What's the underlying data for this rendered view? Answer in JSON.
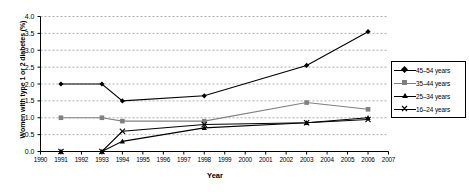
{
  "chart_data": {
    "type": "line",
    "title": "",
    "xlabel": "Year",
    "ylabel": "Women with type 1 or 2 diabetes (%)",
    "xlim": [
      1990,
      2007
    ],
    "ylim": [
      0.0,
      4.0
    ],
    "grid": true,
    "legend_position": "right",
    "xticks": [
      "1990",
      "1991",
      "1992",
      "1993",
      "1994",
      "1995",
      "1996",
      "1997",
      "1998",
      "1999",
      "2000",
      "2001",
      "2002",
      "2003",
      "2004",
      "2005",
      "2006",
      "2007"
    ],
    "yticks": [
      "0.0",
      "0.5",
      "1.0",
      "1.5",
      "2.0",
      "2.5",
      "3.0",
      "3.5",
      "4.0"
    ],
    "series": [
      {
        "name": "45–54 years",
        "marker": "diamond",
        "color": "#000000",
        "x": [
          1991,
          1993,
          1994,
          1998,
          2003,
          2006
        ],
        "values": [
          2.0,
          2.0,
          1.5,
          1.65,
          2.55,
          3.55
        ]
      },
      {
        "name": "35–44 years",
        "marker": "square",
        "color": "#808080",
        "x": [
          1991,
          1993,
          1994,
          1998,
          2003,
          2006
        ],
        "values": [
          1.0,
          1.0,
          0.9,
          0.9,
          1.45,
          1.25
        ]
      },
      {
        "name": "25–34 years",
        "marker": "triangle",
        "color": "#000000",
        "x": [
          1991,
          1993,
          1994,
          1998,
          2003,
          2006
        ],
        "values": [
          0.0,
          0.0,
          0.3,
          0.7,
          0.85,
          1.0
        ]
      },
      {
        "name": "16–24 years",
        "marker": "cross",
        "color": "#000000",
        "x": [
          1991,
          1993,
          1994,
          1998,
          2003,
          2006
        ],
        "values": [
          0.0,
          0.0,
          0.6,
          0.8,
          0.85,
          0.95
        ]
      }
    ]
  },
  "legend": {
    "items": [
      {
        "label": "45–54 years"
      },
      {
        "label": "35–44 years"
      },
      {
        "label": "25–34 years"
      },
      {
        "label": "16–24 years"
      }
    ]
  }
}
